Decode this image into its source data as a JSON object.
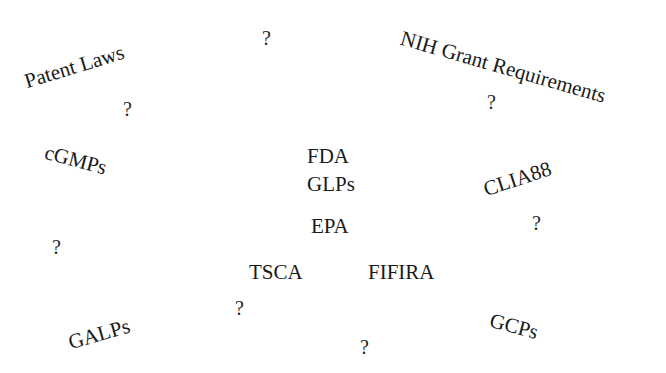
{
  "canvas": {
    "width": 666,
    "height": 373,
    "background_color": "#ffffff",
    "text_color": "#1a1a1a"
  },
  "terms": [
    {
      "id": "patent-laws",
      "label": "Patent Laws",
      "x": 22,
      "y": 72,
      "rotation_deg": -17,
      "font_size": 21
    },
    {
      "id": "nih-grant-requirements",
      "label": "NIH Grant Requirements",
      "x": 404,
      "y": 28,
      "rotation_deg": 16,
      "font_size": 21
    },
    {
      "id": "cgmps",
      "label": "cGMPs",
      "x": 48,
      "y": 142,
      "rotation_deg": 15,
      "font_size": 21
    },
    {
      "id": "fda",
      "label": "FDA",
      "x": 307,
      "y": 146,
      "rotation_deg": 0,
      "font_size": 21
    },
    {
      "id": "clia88",
      "label": "CLIA88",
      "x": 481,
      "y": 180,
      "rotation_deg": -18,
      "font_size": 21
    },
    {
      "id": "glps",
      "label": "GLPs",
      "x": 307,
      "y": 174,
      "rotation_deg": 0,
      "font_size": 21
    },
    {
      "id": "epa",
      "label": "EPA",
      "x": 311,
      "y": 216,
      "rotation_deg": 0,
      "font_size": 21
    },
    {
      "id": "tsca",
      "label": "TSCA",
      "x": 249,
      "y": 262,
      "rotation_deg": 0,
      "font_size": 21
    },
    {
      "id": "fifira",
      "label": "FIFIRA",
      "x": 368,
      "y": 262,
      "rotation_deg": 0,
      "font_size": 21
    },
    {
      "id": "galps",
      "label": "GALPs",
      "x": 66,
      "y": 333,
      "rotation_deg": -16,
      "font_size": 21
    },
    {
      "id": "gcps",
      "label": "GCPs",
      "x": 493,
      "y": 310,
      "rotation_deg": 15,
      "font_size": 21
    }
  ],
  "question_marks": [
    {
      "id": "q-top-center",
      "label": "?",
      "x": 262,
      "y": 28,
      "font_size": 20
    },
    {
      "id": "q-upper-left",
      "label": "?",
      "x": 123,
      "y": 99,
      "font_size": 20
    },
    {
      "id": "q-upper-right",
      "label": "?",
      "x": 487,
      "y": 92,
      "font_size": 20
    },
    {
      "id": "q-mid-right",
      "label": "?",
      "x": 532,
      "y": 213,
      "font_size": 20
    },
    {
      "id": "q-mid-left",
      "label": "?",
      "x": 52,
      "y": 237,
      "font_size": 20
    },
    {
      "id": "q-lower-left",
      "label": "?",
      "x": 235,
      "y": 298,
      "font_size": 20
    },
    {
      "id": "q-bottom-center",
      "label": "?",
      "x": 360,
      "y": 337,
      "font_size": 20
    }
  ]
}
